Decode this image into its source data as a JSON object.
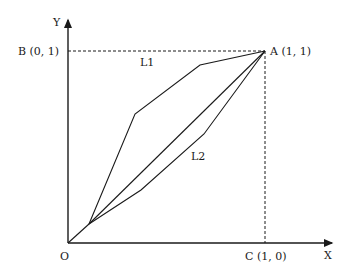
{
  "diagram": {
    "axes": {
      "y_label": "Y",
      "x_label": "X",
      "origin_label": "O"
    },
    "points": {
      "A": "A (1, 1)",
      "B": "B (0, 1)",
      "C": "C (1, 0)"
    },
    "curves": {
      "L1": "L1",
      "L2": "L2"
    },
    "colors": {
      "line": "#1a1a1a",
      "background": "#ffffff"
    }
  }
}
